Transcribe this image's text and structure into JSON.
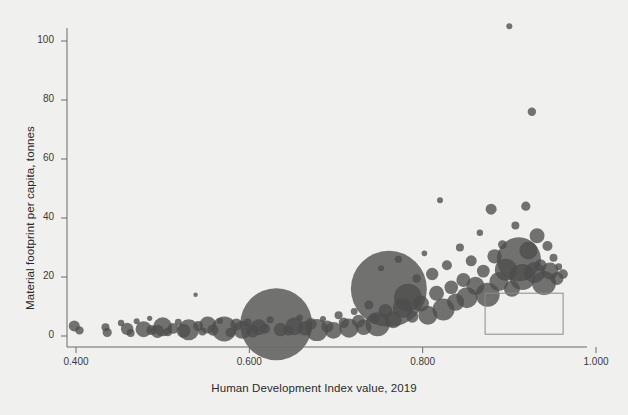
{
  "chart_data": {
    "type": "scatter",
    "title": "",
    "subtitle": "",
    "xlabel": "Human Development Index value, 2019",
    "ylabel": "Material footprint per capita, tonnes",
    "xlim": [
      0.355,
      1.045
    ],
    "ylim": [
      -4,
      108
    ],
    "xticks": [
      0.4,
      0.6,
      0.8,
      1.0
    ],
    "xtick_labels": [
      "0.400",
      "0.600",
      "0.800",
      "1.000"
    ],
    "yticks": [
      0,
      20,
      40,
      60,
      80,
      100
    ],
    "ytick_labels": [
      "0",
      "20",
      "40",
      "60",
      "80",
      "100"
    ],
    "grid": false,
    "legend": {
      "position": "bottom-right",
      "box": {
        "x0": 0.872,
        "x1": 0.962,
        "y0": 0.6,
        "y1": 14.5
      },
      "entries": []
    },
    "marker": {
      "shape": "circle",
      "color": "#4d4d4d",
      "opacity": 0.78,
      "size_encodes": "population"
    },
    "points": [
      {
        "x": 0.398,
        "y": 3.4,
        "r": 5.5
      },
      {
        "x": 0.404,
        "y": 1.9,
        "r": 4.2
      },
      {
        "x": 0.434,
        "y": 3.0,
        "r": 4.0
      },
      {
        "x": 0.436,
        "y": 1.2,
        "r": 4.6
      },
      {
        "x": 0.452,
        "y": 4.4,
        "r": 3.2
      },
      {
        "x": 0.459,
        "y": 2.4,
        "r": 6.2
      },
      {
        "x": 0.463,
        "y": 1.0,
        "r": 4.0
      },
      {
        "x": 0.47,
        "y": 5.0,
        "r": 3.0
      },
      {
        "x": 0.478,
        "y": 2.3,
        "r": 8.0
      },
      {
        "x": 0.485,
        "y": 6.0,
        "r": 2.6
      },
      {
        "x": 0.487,
        "y": 2.0,
        "r": 5.0
      },
      {
        "x": 0.494,
        "y": 1.6,
        "r": 6.6
      },
      {
        "x": 0.5,
        "y": 3.1,
        "r": 9.5
      },
      {
        "x": 0.506,
        "y": 1.4,
        "r": 4.4
      },
      {
        "x": 0.512,
        "y": 2.6,
        "r": 5.4
      },
      {
        "x": 0.518,
        "y": 4.7,
        "r": 3.4
      },
      {
        "x": 0.524,
        "y": 1.8,
        "r": 7.0
      },
      {
        "x": 0.53,
        "y": 2.1,
        "r": 10.5
      },
      {
        "x": 0.538,
        "y": 14.0,
        "r": 2.2
      },
      {
        "x": 0.541,
        "y": 3.4,
        "r": 5.0
      },
      {
        "x": 0.546,
        "y": 1.5,
        "r": 4.0
      },
      {
        "x": 0.552,
        "y": 3.7,
        "r": 8.5
      },
      {
        "x": 0.558,
        "y": 2.0,
        "r": 5.6
      },
      {
        "x": 0.566,
        "y": 5.1,
        "r": 3.0
      },
      {
        "x": 0.571,
        "y": 2.4,
        "r": 12.5
      },
      {
        "x": 0.578,
        "y": 1.2,
        "r": 4.8
      },
      {
        "x": 0.585,
        "y": 3.9,
        "r": 6.0
      },
      {
        "x": 0.592,
        "y": 2.1,
        "r": 9.0
      },
      {
        "x": 0.598,
        "y": 4.6,
        "r": 4.2
      },
      {
        "x": 0.604,
        "y": 1.7,
        "r": 6.4
      },
      {
        "x": 0.611,
        "y": 3.0,
        "r": 8.0
      },
      {
        "x": 0.618,
        "y": 2.5,
        "r": 5.2
      },
      {
        "x": 0.624,
        "y": 5.5,
        "r": 3.6
      },
      {
        "x": 0.631,
        "y": 4.0,
        "r": 36.0
      },
      {
        "x": 0.636,
        "y": 2.2,
        "r": 6.8
      },
      {
        "x": 0.645,
        "y": 1.8,
        "r": 5.0
      },
      {
        "x": 0.652,
        "y": 3.3,
        "r": 9.0
      },
      {
        "x": 0.658,
        "y": 6.2,
        "r": 3.2
      },
      {
        "x": 0.664,
        "y": 2.6,
        "r": 7.2
      },
      {
        "x": 0.671,
        "y": 4.1,
        "r": 5.8
      },
      {
        "x": 0.678,
        "y": 2.0,
        "r": 11.0
      },
      {
        "x": 0.685,
        "y": 5.8,
        "r": 3.0
      },
      {
        "x": 0.69,
        "y": 3.2,
        "r": 6.0
      },
      {
        "x": 0.697,
        "y": 1.9,
        "r": 8.4
      },
      {
        "x": 0.703,
        "y": 7.0,
        "r": 4.0
      },
      {
        "x": 0.709,
        "y": 4.5,
        "r": 5.2
      },
      {
        "x": 0.715,
        "y": 2.7,
        "r": 9.6
      },
      {
        "x": 0.721,
        "y": 8.3,
        "r": 3.4
      },
      {
        "x": 0.726,
        "y": 5.0,
        "r": 6.5
      },
      {
        "x": 0.732,
        "y": 3.0,
        "r": 7.8
      },
      {
        "x": 0.738,
        "y": 10.5,
        "r": 4.6
      },
      {
        "x": 0.744,
        "y": 6.0,
        "r": 5.4
      },
      {
        "x": 0.748,
        "y": 4.0,
        "r": 12.0
      },
      {
        "x": 0.752,
        "y": 23.0,
        "r": 3.0
      },
      {
        "x": 0.757,
        "y": 8.5,
        "r": 7.0
      },
      {
        "x": 0.761,
        "y": 16.0,
        "r": 38.0
      },
      {
        "x": 0.766,
        "y": 5.5,
        "r": 8.5
      },
      {
        "x": 0.772,
        "y": 26.0,
        "r": 3.6
      },
      {
        "x": 0.777,
        "y": 9.5,
        "r": 10.0
      },
      {
        "x": 0.783,
        "y": 13.0,
        "r": 14.0
      },
      {
        "x": 0.788,
        "y": 6.5,
        "r": 6.0
      },
      {
        "x": 0.793,
        "y": 19.5,
        "r": 4.2
      },
      {
        "x": 0.798,
        "y": 11.0,
        "r": 8.0
      },
      {
        "x": 0.802,
        "y": 28.0,
        "r": 2.8
      },
      {
        "x": 0.806,
        "y": 7.0,
        "r": 9.5
      },
      {
        "x": 0.811,
        "y": 21.0,
        "r": 6.2
      },
      {
        "x": 0.816,
        "y": 14.5,
        "r": 7.5
      },
      {
        "x": 0.82,
        "y": 46.0,
        "r": 3.0
      },
      {
        "x": 0.824,
        "y": 9.0,
        "r": 11.0
      },
      {
        "x": 0.828,
        "y": 24.0,
        "r": 5.0
      },
      {
        "x": 0.833,
        "y": 16.5,
        "r": 6.8
      },
      {
        "x": 0.838,
        "y": 11.5,
        "r": 8.6
      },
      {
        "x": 0.843,
        "y": 30.0,
        "r": 4.0
      },
      {
        "x": 0.847,
        "y": 19.0,
        "r": 7.0
      },
      {
        "x": 0.851,
        "y": 13.0,
        "r": 10.5
      },
      {
        "x": 0.856,
        "y": 25.5,
        "r": 5.5
      },
      {
        "x": 0.861,
        "y": 17.0,
        "r": 9.0
      },
      {
        "x": 0.866,
        "y": 35.0,
        "r": 3.2
      },
      {
        "x": 0.87,
        "y": 22.0,
        "r": 6.4
      },
      {
        "x": 0.875,
        "y": 14.0,
        "r": 12.0
      },
      {
        "x": 0.879,
        "y": 43.0,
        "r": 5.5
      },
      {
        "x": 0.883,
        "y": 27.0,
        "r": 7.2
      },
      {
        "x": 0.888,
        "y": 18.5,
        "r": 9.5
      },
      {
        "x": 0.892,
        "y": 31.0,
        "r": 4.4
      },
      {
        "x": 0.896,
        "y": 22.5,
        "r": 11.0
      },
      {
        "x": 0.9,
        "y": 105.0,
        "r": 3.0
      },
      {
        "x": 0.903,
        "y": 16.0,
        "r": 8.0
      },
      {
        "x": 0.907,
        "y": 37.5,
        "r": 4.0
      },
      {
        "x": 0.911,
        "y": 26.0,
        "r": 22.0
      },
      {
        "x": 0.915,
        "y": 20.0,
        "r": 13.0
      },
      {
        "x": 0.919,
        "y": 44.0,
        "r": 4.6
      },
      {
        "x": 0.922,
        "y": 29.0,
        "r": 9.0
      },
      {
        "x": 0.926,
        "y": 76.0,
        "r": 4.2
      },
      {
        "x": 0.929,
        "y": 21.5,
        "r": 10.5
      },
      {
        "x": 0.932,
        "y": 34.0,
        "r": 7.5
      },
      {
        "x": 0.936,
        "y": 24.0,
        "r": 6.0
      },
      {
        "x": 0.94,
        "y": 18.0,
        "r": 12.0
      },
      {
        "x": 0.944,
        "y": 30.5,
        "r": 5.0
      },
      {
        "x": 0.947,
        "y": 22.0,
        "r": 8.5
      },
      {
        "x": 0.951,
        "y": 26.5,
        "r": 4.0
      },
      {
        "x": 0.955,
        "y": 19.5,
        "r": 6.5
      },
      {
        "x": 0.957,
        "y": 23.5,
        "r": 3.4
      },
      {
        "x": 0.962,
        "y": 21.0,
        "r": 4.8
      }
    ]
  },
  "axes": {
    "x_tick_labels": [
      "0.400",
      "0.600",
      "0.800",
      "1.000"
    ],
    "y_tick_labels": [
      "0",
      "20",
      "40",
      "60",
      "80",
      "100"
    ]
  },
  "colors": {
    "background": "#f0f0ee",
    "marker": "#4d4d4d",
    "axis": "#6a6a6a",
    "text": "#2b2b2b",
    "legend_border": "#8a8a8a"
  }
}
